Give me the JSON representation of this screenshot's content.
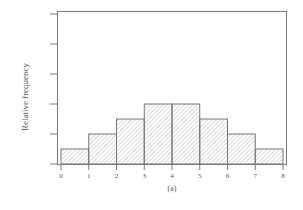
{
  "chart_data": {
    "type": "bar",
    "title": "",
    "caption": "(a)",
    "xlabel": "",
    "ylabel": "Relative frequency",
    "bin_edges": [
      0,
      1,
      2,
      3,
      4,
      5,
      6,
      7,
      8
    ],
    "categories": [
      "0-1",
      "1-2",
      "2-3",
      "3-4",
      "4-5",
      "5-6",
      "6-7",
      "7-8"
    ],
    "values": [
      1,
      2,
      3,
      4,
      4,
      3,
      2,
      1
    ],
    "x_tick_labels": [
      "0",
      "1",
      "2",
      "3",
      "4",
      "5",
      "6",
      "7",
      "8"
    ],
    "y_ticks_count": 6,
    "y_tick_labels": [],
    "ylim": [
      0,
      10
    ],
    "xlim": [
      0,
      8
    ],
    "grid": false,
    "legend": null,
    "bar_fill": "diagonal-hatch",
    "colors": {
      "stroke": "#777777",
      "hatch": "#9a9a9a",
      "frame": "#777777"
    }
  }
}
